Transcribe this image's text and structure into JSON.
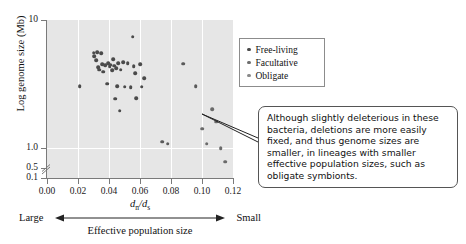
{
  "chart_data": {
    "type": "scatter",
    "title": "",
    "xlabel": "dn/ds",
    "ylabel": "Log genome size (Mb)",
    "xlim": [
      0.0,
      0.12
    ],
    "ylim_log": [
      0.1,
      10
    ],
    "grid": true,
    "x_ticks": [
      "0.00",
      "0.02",
      "0.04",
      "0.06",
      "0.08",
      "0.10",
      "0.12"
    ],
    "x_tick_values": [
      0.0,
      0.02,
      0.04,
      0.06,
      0.08,
      0.1,
      0.12
    ],
    "y_ticks": [
      "10",
      "1.0",
      "0.5",
      "0.1"
    ],
    "y_tick_values": [
      10,
      1.0,
      0.5,
      0.1
    ],
    "y_axis_break": true,
    "y_axis_break_between": [
      "0.5",
      "0.1"
    ],
    "axis_direction_left_label": "Large",
    "axis_direction_right_label": "Small",
    "axis_secondary_label": "Effective population size",
    "legend_position": "top-right-outside",
    "series": [
      {
        "name": "Free-living",
        "color": "#4a4a4a",
        "points": [
          [
            0.0212,
            3.05
          ],
          [
            0.03,
            5.55
          ],
          [
            0.0306,
            5.2
          ],
          [
            0.0318,
            4.85
          ],
          [
            0.0322,
            5.62
          ],
          [
            0.033,
            4.3
          ],
          [
            0.0338,
            4.1
          ],
          [
            0.035,
            5.48
          ],
          [
            0.0356,
            4.52
          ],
          [
            0.0362,
            3.95
          ],
          [
            0.0374,
            4.42
          ],
          [
            0.0388,
            3.18
          ],
          [
            0.0396,
            4.6
          ],
          [
            0.0404,
            4.35
          ],
          [
            0.0412,
            4.48
          ],
          [
            0.042,
            4.05
          ],
          [
            0.0428,
            4.95
          ],
          [
            0.0432,
            4.38
          ],
          [
            0.044,
            2.42
          ],
          [
            0.0448,
            4.22
          ],
          [
            0.0452,
            3.05
          ],
          [
            0.046,
            4.58
          ],
          [
            0.0468,
            1.95
          ],
          [
            0.0476,
            4.1
          ],
          [
            0.0492,
            4.7
          ],
          [
            0.05,
            3.02
          ],
          [
            0.052,
            4.62
          ],
          [
            0.054,
            3.0
          ],
          [
            0.0552,
            7.4
          ],
          [
            0.056,
            4.35
          ],
          [
            0.0568,
            3.85
          ],
          [
            0.0576,
            2.45
          ],
          [
            0.06,
            4.52
          ],
          [
            0.0612,
            3.02
          ],
          [
            0.0628,
            3.5
          ]
        ]
      },
      {
        "name": "Facultative",
        "color": "#5a5a5a",
        "points": [
          [
            0.0742,
            1.12
          ],
          [
            0.078,
            1.08
          ],
          [
            0.096,
            3.05
          ],
          [
            0.088,
            4.55
          ]
        ]
      },
      {
        "name": "Obligate",
        "color": "#6a6a6a",
        "points": [
          [
            0.1,
            1.42
          ],
          [
            0.103,
            1.08
          ],
          [
            0.1065,
            2.02
          ],
          [
            0.109,
            1.6
          ],
          [
            0.115,
            0.78
          ],
          [
            0.112,
            1.0
          ]
        ]
      }
    ]
  },
  "legend": {
    "items": [
      {
        "label": "Free-living"
      },
      {
        "label": "Facultative"
      },
      {
        "label": "Obligate"
      }
    ]
  },
  "callout": {
    "text": "Although slightly deleterious in these bacteria, deletions are more easily fixed, and thus genome sizes are smaller, in lineages with smaller effective population sizes, such as obligate symbionts."
  }
}
